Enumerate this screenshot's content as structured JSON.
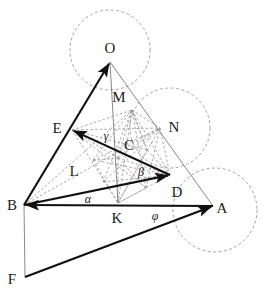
{
  "figure": {
    "width": 263,
    "height": 296,
    "background": "#ffffff",
    "stroke_solid": "#111111",
    "stroke_thin": "#7a7a7a",
    "stroke_dashed": "#8a8a8a"
  },
  "point_labels": [
    {
      "id": "O",
      "text": "O",
      "x": 110,
      "y": 48,
      "kind": "point"
    },
    {
      "id": "M",
      "text": "M",
      "x": 119,
      "y": 97,
      "kind": "point"
    },
    {
      "id": "E",
      "text": "E",
      "x": 57,
      "y": 128,
      "kind": "point"
    },
    {
      "id": "N",
      "text": "N",
      "x": 174,
      "y": 127,
      "kind": "point"
    },
    {
      "id": "C",
      "text": "C",
      "x": 129,
      "y": 145,
      "kind": "point"
    },
    {
      "id": "L",
      "text": "L",
      "x": 74,
      "y": 171,
      "kind": "point"
    },
    {
      "id": "D",
      "text": "D",
      "x": 177,
      "y": 192,
      "kind": "point"
    },
    {
      "id": "B",
      "text": "B",
      "x": 12,
      "y": 205,
      "kind": "point"
    },
    {
      "id": "A",
      "text": "A",
      "x": 222,
      "y": 208,
      "kind": "point"
    },
    {
      "id": "K",
      "text": "K",
      "x": 117,
      "y": 218,
      "kind": "point"
    },
    {
      "id": "F",
      "text": "F",
      "x": 12,
      "y": 279,
      "kind": "point"
    }
  ],
  "angle_labels": [
    {
      "id": "gamma",
      "text": "γ",
      "x": 106,
      "y": 136,
      "kind": "angle"
    },
    {
      "id": "beta",
      "text": "β",
      "x": 141,
      "y": 172,
      "kind": "angle"
    },
    {
      "id": "alpha",
      "text": "α",
      "x": 88,
      "y": 199,
      "kind": "angle"
    },
    {
      "id": "phi",
      "text": "φ",
      "x": 155,
      "y": 216,
      "kind": "angle"
    }
  ],
  "vertices": {
    "O": {
      "x": 110,
      "y": 62
    },
    "M": {
      "x": 132,
      "y": 110
    },
    "E": {
      "x": 72,
      "y": 130
    },
    "N": {
      "x": 160,
      "y": 128
    },
    "C": {
      "x": 118,
      "y": 158
    },
    "L": {
      "x": 93,
      "y": 160
    },
    "D": {
      "x": 170,
      "y": 175
    },
    "B": {
      "x": 24,
      "y": 205
    },
    "A": {
      "x": 213,
      "y": 206
    },
    "K": {
      "x": 118,
      "y": 203
    },
    "F": {
      "x": 25,
      "y": 277
    },
    "P": {
      "x": 147,
      "y": 150
    },
    "Q": {
      "x": 103,
      "y": 182
    },
    "R": {
      "x": 146,
      "y": 188
    }
  },
  "circles": [
    {
      "id": "circle-top",
      "cx": 110,
      "cy": 50,
      "r": 40
    },
    {
      "id": "circle-middle-right",
      "cx": 170,
      "cy": 128,
      "r": 40
    },
    {
      "id": "circle-bottom-right",
      "cx": 215,
      "cy": 210,
      "r": 42
    }
  ],
  "arrows": [
    {
      "id": "arrow-B-O",
      "from": "B",
      "to": "O"
    },
    {
      "id": "arrow-D-E",
      "from": "D",
      "to": "E"
    },
    {
      "id": "arrow-A-B",
      "from": "A",
      "to": "B"
    },
    {
      "id": "arrow-B-D",
      "from": "B",
      "to": "D"
    },
    {
      "id": "arrow-F-A",
      "from": "F",
      "to": "A"
    }
  ],
  "thin_lines": [
    {
      "id": "line-B-O",
      "from": "B",
      "to": "O"
    },
    {
      "id": "line-O-A",
      "from": "O",
      "to": "A"
    },
    {
      "id": "line-B-A",
      "from": "B",
      "to": "A"
    },
    {
      "id": "line-B-F",
      "from": "B",
      "to": "F"
    },
    {
      "id": "line-F-A",
      "from": "F",
      "to": "A"
    },
    {
      "id": "line-O-K",
      "from": "O",
      "to": "K"
    },
    {
      "id": "line-E-D",
      "from": "E",
      "to": "D"
    }
  ],
  "dashed_lines": [
    {
      "id": "dash-E-N",
      "from": "E",
      "to": "N"
    },
    {
      "id": "dash-E-M",
      "from": "E",
      "to": "M"
    },
    {
      "id": "dash-M-N",
      "from": "M",
      "to": "N"
    },
    {
      "id": "dash-E-K",
      "from": "E",
      "to": "K"
    },
    {
      "id": "dash-K-N",
      "from": "K",
      "to": "N"
    },
    {
      "id": "dash-E-D",
      "from": "E",
      "to": "D"
    },
    {
      "id": "dash-K-D",
      "from": "K",
      "to": "D"
    },
    {
      "id": "dash-M-K",
      "from": "M",
      "to": "K"
    },
    {
      "id": "dash-M-D",
      "from": "M",
      "to": "D"
    },
    {
      "id": "dash-N-D",
      "from": "N",
      "to": "D"
    },
    {
      "id": "dash-B-N",
      "from": "B",
      "to": "N"
    },
    {
      "id": "dash-B-M",
      "from": "B",
      "to": "M"
    },
    {
      "id": "dash-L-M",
      "from": "L",
      "to": "M"
    },
    {
      "id": "dash-L-N",
      "from": "L",
      "to": "N"
    },
    {
      "id": "dash-L-K",
      "from": "L",
      "to": "K"
    },
    {
      "id": "dash-L-D",
      "from": "L",
      "to": "D"
    },
    {
      "id": "dash-C-M",
      "from": "C",
      "to": "M"
    },
    {
      "id": "dash-C-N",
      "from": "C",
      "to": "N"
    },
    {
      "id": "dash-C-E",
      "from": "C",
      "to": "E"
    },
    {
      "id": "dash-C-K",
      "from": "C",
      "to": "K"
    },
    {
      "id": "dash-C-D",
      "from": "C",
      "to": "D"
    },
    {
      "id": "dash-P-K",
      "from": "P",
      "to": "K"
    },
    {
      "id": "dash-P-E",
      "from": "P",
      "to": "E"
    },
    {
      "id": "dash-P-M",
      "from": "P",
      "to": "M"
    },
    {
      "id": "dash-P-D",
      "from": "P",
      "to": "D"
    },
    {
      "id": "dash-Q-M",
      "from": "Q",
      "to": "M"
    },
    {
      "id": "dash-Q-N",
      "from": "Q",
      "to": "N"
    },
    {
      "id": "dash-Q-D",
      "from": "Q",
      "to": "D"
    },
    {
      "id": "dash-R-M",
      "from": "R",
      "to": "M"
    },
    {
      "id": "dash-R-E",
      "from": "R",
      "to": "E"
    },
    {
      "id": "dash-R-K",
      "from": "R",
      "to": "K"
    },
    {
      "id": "dash-R-N",
      "from": "R",
      "to": "N"
    },
    {
      "id": "dash-L-C",
      "from": "L",
      "to": "C"
    },
    {
      "id": "dash-C-R",
      "from": "C",
      "to": "R"
    },
    {
      "id": "dash-M-P",
      "from": "M",
      "to": "P"
    }
  ]
}
